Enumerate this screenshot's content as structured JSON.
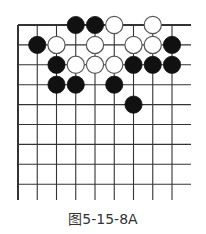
{
  "figure": {
    "caption": "图5-15-8A",
    "board": {
      "origin": {
        "x": 18,
        "y": 25
      },
      "col_spacing": 19.25,
      "row_spacing": 19.9,
      "visible_cols": 9,
      "visible_rows": 9,
      "line_right_end": 191,
      "line_bottom_end": 200,
      "top_edge": true,
      "left_edge": true,
      "stone_radius": 8.6,
      "colors": {
        "line": "#333333",
        "black": "#111111",
        "white_fill": "#ffffff",
        "white_stroke": "#555555"
      }
    },
    "stones": [
      {
        "color": "black",
        "col": 3,
        "row": 0
      },
      {
        "color": "black",
        "col": 4,
        "row": 0
      },
      {
        "color": "white",
        "col": 5,
        "row": 0
      },
      {
        "color": "white",
        "col": 7,
        "row": 0
      },
      {
        "color": "black",
        "col": 1,
        "row": 1
      },
      {
        "color": "white",
        "col": 2,
        "row": 1
      },
      {
        "color": "white",
        "col": 4,
        "row": 1
      },
      {
        "color": "white",
        "col": 6,
        "row": 1
      },
      {
        "color": "white",
        "col": 7,
        "row": 1
      },
      {
        "color": "black",
        "col": 8,
        "row": 1
      },
      {
        "color": "black",
        "col": 2,
        "row": 2
      },
      {
        "color": "white",
        "col": 3,
        "row": 2
      },
      {
        "color": "white",
        "col": 4,
        "row": 2
      },
      {
        "color": "white",
        "col": 5,
        "row": 2
      },
      {
        "color": "black",
        "col": 6,
        "row": 2
      },
      {
        "color": "black",
        "col": 7,
        "row": 2
      },
      {
        "color": "black",
        "col": 8,
        "row": 2
      },
      {
        "color": "black",
        "col": 2,
        "row": 3
      },
      {
        "color": "black",
        "col": 3,
        "row": 3
      },
      {
        "color": "black",
        "col": 5,
        "row": 3
      },
      {
        "color": "black",
        "col": 6,
        "row": 4
      }
    ]
  }
}
